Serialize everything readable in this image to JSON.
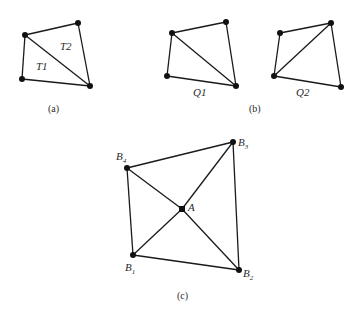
{
  "figure": {
    "panels": [
      {
        "id": "a",
        "caption": "(a)",
        "regions": [
          {
            "label": "T2",
            "x": 58,
            "y": 51
          },
          {
            "label": "T1",
            "x": 35,
            "y": 70
          }
        ],
        "nodes": [
          [
            25,
            35
          ],
          [
            78,
            23
          ],
          [
            22,
            79
          ],
          [
            90,
            86
          ]
        ],
        "edges": [
          [
            0,
            1
          ],
          [
            1,
            3
          ],
          [
            3,
            2
          ],
          [
            2,
            0
          ],
          [
            0,
            3
          ]
        ]
      },
      {
        "id": "b",
        "caption": "(b)",
        "subfigures": [
          {
            "label": "Q1",
            "nodes": [
              [
                172,
                33
              ],
              [
                226,
                22
              ],
              [
                167,
                76
              ],
              [
                236,
                86
              ]
            ],
            "edges": [
              [
                0,
                1
              ],
              [
                1,
                3
              ],
              [
                3,
                2
              ],
              [
                2,
                0
              ],
              [
                0,
                3
              ]
            ]
          },
          {
            "label": "Q2",
            "nodes": [
              [
                280,
                33
              ],
              [
                331,
                23
              ],
              [
                274,
                76
              ],
              [
                341,
                87
              ]
            ],
            "edges": [
              [
                0,
                1
              ],
              [
                1,
                3
              ],
              [
                3,
                2
              ],
              [
                2,
                0
              ],
              [
                2,
                1
              ]
            ]
          }
        ]
      },
      {
        "id": "c",
        "caption": "(c)",
        "nodes": {
          "B4": {
            "label": "B",
            "sub": "4",
            "x": 127,
            "y": 168
          },
          "B3": {
            "label": "B",
            "sub": "3",
            "x": 233,
            "y": 142
          },
          "A": {
            "label": "A",
            "sub": "",
            "x": 182,
            "y": 209
          },
          "B1": {
            "label": "B",
            "sub": "1",
            "x": 133,
            "y": 255
          },
          "B2": {
            "label": "B",
            "sub": "2",
            "x": 239,
            "y": 270
          }
        }
      }
    ]
  }
}
